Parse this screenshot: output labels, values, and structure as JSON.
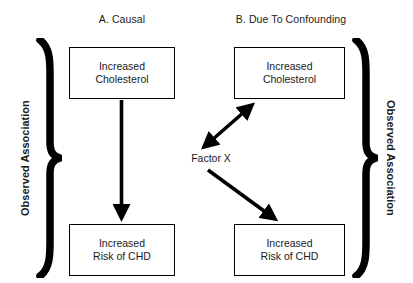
{
  "figure": {
    "width": 413,
    "height": 283,
    "background": "#ffffff",
    "stroke_color": "#000000",
    "text_color": "#1a1a1a"
  },
  "panels": {
    "a": {
      "title": "A. Causal",
      "top_node": {
        "line1": "Increased",
        "line2": "Cholesterol"
      },
      "bottom_node": {
        "line1": "Increased",
        "line2": "Risk of CHD"
      },
      "arrow": {
        "kind": "single-headed-down",
        "from": "top_node",
        "to": "bottom_node"
      }
    },
    "b": {
      "title": "B. Due To Confounding",
      "top_node": {
        "line1": "Increased",
        "line2": "Cholesterol"
      },
      "bottom_node": {
        "line1": "Increased",
        "line2": "Risk of CHD"
      },
      "confounder_label": "Factor X",
      "arrows": [
        {
          "kind": "double-headed-diagonal",
          "from": "confounder_label",
          "to": "top_node"
        },
        {
          "kind": "single-headed-diagonal",
          "from": "confounder_label",
          "to": "bottom_node"
        }
      ]
    }
  },
  "annotations": {
    "left_brace_label": "Observed Association",
    "right_brace_label": "Observed Association",
    "left_brace_glyph": "right-pointing-curly-brace",
    "right_brace_glyph": "right-pointing-curly-brace"
  }
}
